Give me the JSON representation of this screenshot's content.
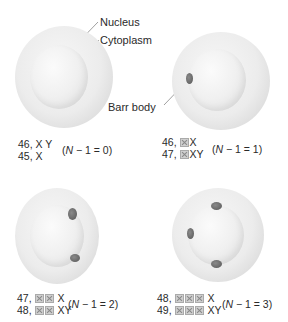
{
  "labels": {
    "nucleus": "Nucleus",
    "cytoplasm": "Cytoplasm",
    "barr_body": "Barr body"
  },
  "panels": [
    {
      "barr_count": 0,
      "line1_num": "46,",
      "line1_boxes": 0,
      "line1_tail": "X Y",
      "line2_num": "45,",
      "line2_boxes": 0,
      "line2_tail": "X",
      "equation": "(N − 1 = 0)"
    },
    {
      "barr_count": 1,
      "line1_num": "46,",
      "line1_boxes": 1,
      "line1_tail": "X",
      "line2_num": "47,",
      "line2_boxes": 1,
      "line2_tail": "XY",
      "equation": "(N − 1 = 1)"
    },
    {
      "barr_count": 2,
      "line1_num": "47,",
      "line1_boxes": 2,
      "line1_tail": "X",
      "line2_num": "48,",
      "line2_boxes": 2,
      "line2_tail": "XY",
      "equation": "(N − 1 = 2)"
    },
    {
      "barr_count": 3,
      "line1_num": "48,",
      "line1_boxes": 3,
      "line1_tail": "X",
      "line2_num": "49,",
      "line2_boxes": 3,
      "line2_tail": "XY",
      "equation": "(N − 1 = 3)"
    }
  ],
  "colors": {
    "barr_body": "#6b6b6b",
    "cell": "#e8e8e8",
    "box": "#cfcfcf"
  }
}
